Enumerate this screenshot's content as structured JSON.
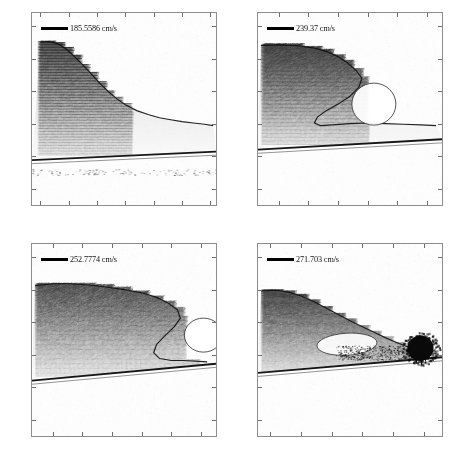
{
  "figure": {
    "title": "",
    "panel_count": 4,
    "background_color": "#ffffff",
    "axes_background_color": "#fcfcfc",
    "frame_color": "#8d8d8d"
  },
  "chart_data": {
    "type": "scatter",
    "xlabel": "",
    "ylabel": "",
    "grid": false,
    "legend_position": "upper-left",
    "panels": [
      {
        "id": "panel-0",
        "legend": "185.5586 cm/s",
        "legend_value": 185.5586,
        "legend_units": "cm/s",
        "xlim": [
          -101.5,
          -69.0
        ],
        "ylim": [
          -12.5,
          17.0
        ],
        "xticks": [
          -100,
          -95,
          -90,
          -85,
          -80,
          -75,
          -70
        ],
        "xtick_labels": [
          "-100",
          "-95",
          "-90",
          "-85",
          "-80",
          "-75",
          "-70"
        ],
        "yticks": [
          15,
          10,
          5,
          0,
          -5,
          -10
        ],
        "ytick_labels": [
          "15",
          "10",
          "5",
          "0",
          "-5",
          "-10"
        ],
        "crest_x": -99.0,
        "crest_y": 12.6,
        "trough_y": -0.3,
        "bed_line_y_left": -5.6,
        "bed_line_y_right": -4.3,
        "vector_field_x_extent": [
          -100.5,
          -84.0
        ],
        "vector_field_y_extent": [
          -4.8,
          12.6
        ],
        "surface_profile": {
          "x": [
            -100.0,
            -98.5,
            -97.0,
            -95.5,
            -94.0,
            -92.5,
            -91.0,
            -89.5,
            -88.0,
            -86.5,
            -85.0,
            -83.0,
            -81.0,
            -79.0,
            -77.0,
            -75.0,
            -73.0,
            -71.0,
            -69.5
          ],
          "y": [
            12.5,
            12.6,
            12.3,
            11.5,
            10.3,
            9.0,
            7.6,
            6.2,
            4.9,
            3.8,
            2.9,
            2.0,
            1.4,
            0.9,
            0.6,
            0.3,
            0.1,
            -0.1,
            -0.3
          ]
        },
        "breaking_stage": "pre-breaking steepening crest"
      },
      {
        "id": "panel-1",
        "legend": "239.37 cm/s",
        "legend_value": 239.37,
        "legend_units": "cm/s",
        "xlim": [
          -58.5,
          -27.5
        ],
        "ylim": [
          -12.5,
          17.0
        ],
        "xticks": [
          -55,
          -50,
          -45,
          -40,
          -35,
          -30
        ],
        "xtick_labels": [
          "-55",
          "-50",
          "-45",
          "-40",
          "-35",
          "-30"
        ],
        "yticks": [
          15,
          10,
          5,
          0,
          -5,
          -10
        ],
        "ytick_labels": [
          "15",
          "10",
          "5",
          "0",
          "-5",
          "-10"
        ],
        "crest_x": -41.0,
        "crest_y": 12.0,
        "trough_y": 0.0,
        "bed_line_y_left": -4.0,
        "bed_line_y_right": -2.4,
        "vector_field_x_extent": [
          -58.0,
          -40.0
        ],
        "vector_field_y_extent": [
          -3.2,
          12.1
        ],
        "surface_profile": {
          "x": [
            -58.0,
            -55.0,
            -52.0,
            -49.0,
            -47.0,
            -45.0,
            -43.5,
            -42.0,
            -41.0,
            -41.5,
            -43.0,
            -45.0,
            -47.0,
            -48.5,
            -49.0,
            -48.0,
            -46.0,
            -43.0,
            -40.0,
            -37.0,
            -34.0,
            -31.0,
            -28.5
          ],
          "y": [
            12.0,
            12.1,
            12.0,
            11.6,
            11.1,
            10.3,
            9.4,
            8.2,
            7.0,
            5.6,
            4.2,
            3.0,
            2.0,
            1.0,
            0.1,
            -0.3,
            -0.2,
            0.0,
            0.1,
            0.0,
            -0.1,
            -0.2,
            -0.3
          ]
        },
        "breaking_stage": "overturning jet, plunging"
      },
      {
        "id": "panel-2",
        "legend": "252.7774 cm/s",
        "legend_value": 252.7774,
        "legend_units": "cm/s",
        "xlim": [
          -58.5,
          -27.5
        ],
        "ylim": [
          -12.5,
          17.0
        ],
        "xticks": [
          -55,
          -50,
          -45,
          -40,
          -35,
          -30
        ],
        "xtick_labels": [
          "-55",
          "-50",
          "-45",
          "-40",
          "-35",
          "-30"
        ],
        "yticks": [
          15,
          10,
          5,
          0,
          -5,
          -10
        ],
        "ytick_labels": [
          "15",
          "10",
          "5",
          "0",
          "-5",
          "-10"
        ],
        "crest_x": -34.0,
        "crest_y": 10.8,
        "trough_y": -0.5,
        "bed_line_y_left": -4.0,
        "bed_line_y_right": -1.4,
        "vector_field_x_extent": [
          -58.0,
          -30.5
        ],
        "vector_field_y_extent": [
          -3.3,
          10.8
        ],
        "surface_profile": {
          "x": [
            -58.0,
            -55.0,
            -52.0,
            -49.0,
            -46.0,
            -43.0,
            -40.0,
            -37.5,
            -35.5,
            -34.0,
            -33.5,
            -34.5,
            -36.0,
            -37.5,
            -38.0,
            -37.0,
            -35.0,
            -33.0,
            -31.0,
            -29.0
          ],
          "y": [
            10.6,
            10.9,
            10.9,
            10.7,
            10.4,
            10.0,
            9.5,
            8.8,
            7.9,
            6.9,
            5.6,
            4.3,
            3.0,
            1.6,
            0.3,
            -0.6,
            -0.9,
            -0.9,
            -1.0,
            -1.1
          ]
        },
        "breaking_stage": "jet impact, splash-up forming"
      },
      {
        "id": "panel-3",
        "legend": "271.703 cm/s",
        "legend_value": 271.703,
        "legend_units": "cm/s",
        "xlim": [
          -37.0,
          -7.0
        ],
        "ylim": [
          -12.5,
          17.0
        ],
        "xticks": [
          -35,
          -30,
          -25,
          -20,
          -15,
          -10
        ],
        "xtick_labels": [
          "-35",
          "-30",
          "-25",
          "-20",
          "-15",
          "-10"
        ],
        "yticks": [
          15,
          10,
          5,
          0,
          -5,
          -10
        ],
        "ytick_labels": [
          "15",
          "10",
          "5",
          "0",
          "-5",
          "-10"
        ],
        "crest_x": -35.0,
        "crest_y": 9.9,
        "trough_y": 0.2,
        "bed_line_y_left": -2.8,
        "bed_line_y_right": -0.4,
        "vector_field_x_extent": [
          -36.5,
          -12.0
        ],
        "vector_field_y_extent": [
          -2.6,
          9.9
        ],
        "surface_profile": {
          "x": [
            -36.5,
            -34.0,
            -32.0,
            -30.0,
            -28.0,
            -26.0,
            -24.0,
            -22.0,
            -20.0,
            -18.0,
            -16.0,
            -14.0,
            -12.0,
            -10.0,
            -8.0
          ],
          "y": [
            9.8,
            9.9,
            9.6,
            9.0,
            8.2,
            7.2,
            6.2,
            5.2,
            4.3,
            3.4,
            2.5,
            1.7,
            1.0,
            0.4,
            0.2
          ]
        },
        "dark_blob": {
          "center_x": -10.5,
          "center_y": 1.0,
          "radius": 2.6
        },
        "breaking_stage": "fully developed turbulent bore with aerated roller"
      }
    ]
  }
}
